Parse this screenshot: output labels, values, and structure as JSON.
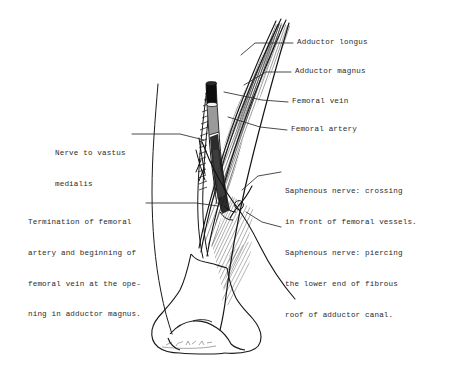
{
  "figure": {
    "medium": "hand-drawn ink line diagram with typewritten labels",
    "background_color": "#ffffff",
    "ink_color": "#1a1a1a",
    "label_text_color": "#2b2b2b",
    "signature_present": true
  },
  "labels": {
    "adductor_longus": "Adductor longus",
    "adductor_magnus": "Adductor magnus",
    "femoral_vein": "Femoral vein",
    "femoral_artery": "Femoral artery",
    "saphenous_crossing_line1": "Saphenous nerve: crossing",
    "saphenous_crossing_line2": "in front of femoral vessels.",
    "saphenous_piercing_line1": "Saphenous nerve: piercing",
    "saphenous_piercing_line2": "the lower end of fibrous",
    "saphenous_piercing_line3": "roof of adductor canal.",
    "nerve_to_vastus_line1": "Nerve to vastus",
    "nerve_to_vastus_line2": "medialis",
    "termination_line1": "Termination of femoral",
    "termination_line2": "artery and beginning of",
    "termination_line3": "femoral vein at the ope-",
    "termination_line4": "ning in adductor magnus."
  },
  "structures": [
    {
      "name": "adductor-longus-muscle",
      "kind": "muscle",
      "rendering": "fine parallel hatching, fibres converging superomedially"
    },
    {
      "name": "adductor-magnus-muscle",
      "kind": "muscle",
      "rendering": "fine parallel hatching deep to adductor longus"
    },
    {
      "name": "femoral-vein",
      "kind": "vessel",
      "rendering": "dark solid tube, upper part of canal"
    },
    {
      "name": "femoral-artery",
      "kind": "vessel",
      "rendering": "pale cylinder below the vein, descending into the canal"
    },
    {
      "name": "saphenous-nerve",
      "kind": "nerve",
      "rendering": "fine line crossing in front of the vessels, then piercing the roof"
    },
    {
      "name": "nerve-to-vastus-medialis",
      "kind": "nerve",
      "rendering": "fine line descending on the medial aspect"
    },
    {
      "name": "distal-femur",
      "kind": "bone",
      "rendering": "outline of the lower shaft and condyles of the femur"
    },
    {
      "name": "thigh-outline",
      "kind": "surface-contour",
      "rendering": "long sweeping curve of the medial thigh"
    }
  ]
}
